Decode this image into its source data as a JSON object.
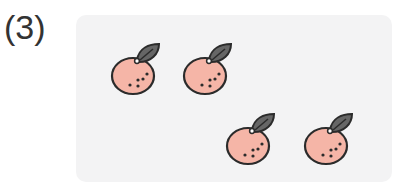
{
  "problem": {
    "label": "(3)",
    "item_name": "orange",
    "count": 4
  },
  "colors": {
    "panel_bg": "#f3f3f4",
    "fruit_fill": "#f5b5a7",
    "outline": "#2b2b2b",
    "leaf": "#666666",
    "dots": "#2b2b2b"
  },
  "fruits": [
    {
      "x": 105,
      "y": 38
    },
    {
      "x": 177,
      "y": 38
    },
    {
      "x": 220,
      "y": 108
    },
    {
      "x": 298,
      "y": 108
    }
  ]
}
